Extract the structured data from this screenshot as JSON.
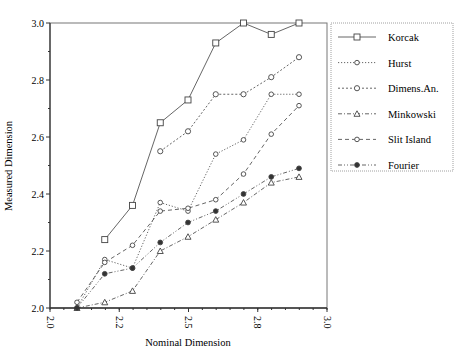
{
  "chart_data": {
    "type": "line",
    "title": "",
    "xlabel": "Nominal Dimension",
    "ylabel": "Measured Dimension",
    "xlim": [
      2.0,
      3.0
    ],
    "ylim": [
      2.0,
      3.0
    ],
    "x_ticks": [
      "2.0",
      "2.2",
      "2.5",
      "2.8",
      "3.0"
    ],
    "y_ticks": [
      "2.0",
      "2.2",
      "2.4",
      "2.6",
      "2.8",
      "3.0"
    ],
    "grid": false,
    "legend_position": "right",
    "x": [
      2.1,
      2.2,
      2.3,
      2.4,
      2.5,
      2.6,
      2.7,
      2.8,
      2.9
    ],
    "series": [
      {
        "name": "Korcak",
        "marker": "square",
        "dash": "solid",
        "values": [
          null,
          2.24,
          2.36,
          2.65,
          2.73,
          2.93,
          3.0,
          2.96,
          3.0
        ]
      },
      {
        "name": "Hurst",
        "marker": "diamond",
        "dash": "dotted",
        "values": [
          2.0,
          2.17,
          2.14,
          2.37,
          2.34,
          2.54,
          2.59,
          2.75,
          2.75
        ]
      },
      {
        "name": "Dimens.An.",
        "marker": "circle",
        "dash": "short-dash",
        "values": [
          null,
          null,
          null,
          2.55,
          2.62,
          2.75,
          2.75,
          2.81,
          2.88
        ]
      },
      {
        "name": "Minkowski",
        "marker": "triangle",
        "dash": "dash-dot",
        "values": [
          2.0,
          2.02,
          2.06,
          2.2,
          2.25,
          2.31,
          2.37,
          2.44,
          2.46
        ]
      },
      {
        "name": "Slit Island",
        "marker": "open-diamond",
        "dash": "long-dash",
        "values": [
          2.02,
          2.16,
          2.22,
          2.34,
          2.35,
          2.38,
          2.47,
          2.61,
          2.71
        ]
      },
      {
        "name": "Fourier",
        "marker": "filled-diamond",
        "dash": "dash-dot-dot",
        "values": [
          2.0,
          2.12,
          2.14,
          2.23,
          2.3,
          2.34,
          2.4,
          2.46,
          2.49
        ]
      }
    ]
  },
  "colors": {
    "line": "#555555",
    "axis": "#333333",
    "legend_border": "#888888"
  }
}
